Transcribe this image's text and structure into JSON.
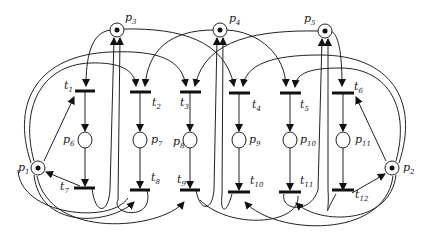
{
  "diagram": {
    "type": "petri-net",
    "places": [
      {
        "id": "p1",
        "name": "p",
        "sub": "1",
        "tokens": 1
      },
      {
        "id": "p2",
        "name": "p",
        "sub": "2",
        "tokens": 1
      },
      {
        "id": "p3",
        "name": "p",
        "sub": "3",
        "tokens": 1
      },
      {
        "id": "p4",
        "name": "p",
        "sub": "4",
        "tokens": 1
      },
      {
        "id": "p5",
        "name": "p",
        "sub": "5",
        "tokens": 1
      },
      {
        "id": "p6",
        "name": "p",
        "sub": "6",
        "tokens": 0
      },
      {
        "id": "p7",
        "name": "p",
        "sub": "7",
        "tokens": 0
      },
      {
        "id": "p8",
        "name": "p",
        "sub": "8",
        "tokens": 0
      },
      {
        "id": "p9",
        "name": "p",
        "sub": "9",
        "tokens": 0
      },
      {
        "id": "p10",
        "name": "p",
        "sub": "10",
        "tokens": 0
      },
      {
        "id": "p11",
        "name": "p",
        "sub": "11",
        "tokens": 0
      }
    ],
    "transitions": [
      {
        "id": "t1",
        "name": "t",
        "sub": "1"
      },
      {
        "id": "t2",
        "name": "t",
        "sub": "2"
      },
      {
        "id": "t3",
        "name": "t",
        "sub": "3"
      },
      {
        "id": "t4",
        "name": "t",
        "sub": "4"
      },
      {
        "id": "t5",
        "name": "t",
        "sub": "5"
      },
      {
        "id": "t6",
        "name": "t",
        "sub": "6"
      },
      {
        "id": "t7",
        "name": "t",
        "sub": "7"
      },
      {
        "id": "t8",
        "name": "t",
        "sub": "8"
      },
      {
        "id": "t9",
        "name": "t",
        "sub": "9"
      },
      {
        "id": "t10",
        "name": "t",
        "sub": "10"
      },
      {
        "id": "t11",
        "name": "t",
        "sub": "11"
      },
      {
        "id": "t12",
        "name": "t",
        "sub": "12"
      }
    ]
  }
}
